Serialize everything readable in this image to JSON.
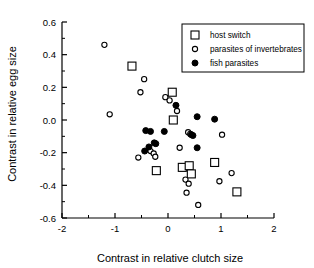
{
  "chart_data": {
    "type": "scatter",
    "title": "",
    "xlabel": "Contrast in relative clutch size",
    "ylabel": "Contrast in relative egg size",
    "xlim": [
      -2,
      2
    ],
    "ylim": [
      -0.6,
      0.6
    ],
    "xticks": [
      -2,
      -1,
      0,
      1,
      2
    ],
    "xtick_labels": [
      "-2",
      "-1",
      "0",
      "1",
      "2"
    ],
    "yticks": [
      -0.6,
      -0.4,
      -0.2,
      0.0,
      0.2,
      0.4,
      0.6
    ],
    "ytick_labels": [
      "-0.6",
      "-0.4",
      "-0.2",
      "0.0",
      "0.2",
      "0.4",
      "0.6"
    ],
    "xminor_step": 0.5,
    "yminor_step": 0.1,
    "grid": false,
    "legend_position": "top-right",
    "series": [
      {
        "name": "host switch",
        "marker": "open-square",
        "points": [
          [
            -0.68,
            0.33
          ],
          [
            0.08,
            0.17
          ],
          [
            0.1,
            0.0
          ],
          [
            -0.22,
            -0.31
          ],
          [
            0.27,
            -0.29
          ],
          [
            0.4,
            -0.28
          ],
          [
            0.44,
            -0.33
          ],
          [
            0.88,
            -0.26
          ],
          [
            1.3,
            -0.44
          ]
        ]
      },
      {
        "name": "parasites of invertebrates",
        "marker": "open-circle",
        "points": [
          [
            -1.2,
            0.46
          ],
          [
            -1.1,
            0.035
          ],
          [
            -0.45,
            0.25
          ],
          [
            -0.52,
            0.17
          ],
          [
            -0.05,
            0.14
          ],
          [
            0.03,
            0.12
          ],
          [
            0.17,
            0.055
          ],
          [
            0.38,
            -0.075
          ],
          [
            0.42,
            -0.085
          ],
          [
            -0.56,
            -0.23
          ],
          [
            -0.33,
            -0.19
          ],
          [
            -0.27,
            -0.205
          ],
          [
            -0.24,
            -0.225
          ],
          [
            0.22,
            -0.17
          ],
          [
            0.33,
            -0.365
          ],
          [
            0.39,
            -0.39
          ],
          [
            0.35,
            -0.445
          ],
          [
            0.57,
            -0.52
          ],
          [
            1.02,
            -0.09
          ],
          [
            0.97,
            -0.375
          ],
          [
            1.2,
            -0.325
          ]
        ]
      },
      {
        "name": "fish parasites",
        "marker": "filled-circle",
        "points": [
          [
            0.15,
            0.09
          ],
          [
            0.55,
            0.02
          ],
          [
            0.88,
            0.005
          ],
          [
            -0.07,
            -0.07
          ],
          [
            -0.42,
            -0.065
          ],
          [
            -0.33,
            -0.07
          ],
          [
            -0.44,
            -0.19
          ],
          [
            -0.36,
            -0.165
          ],
          [
            -0.26,
            -0.14
          ],
          [
            -0.23,
            -0.145
          ],
          [
            0.44,
            -0.09
          ],
          [
            0.47,
            -0.095
          ],
          [
            0.55,
            -0.17
          ]
        ]
      }
    ]
  }
}
